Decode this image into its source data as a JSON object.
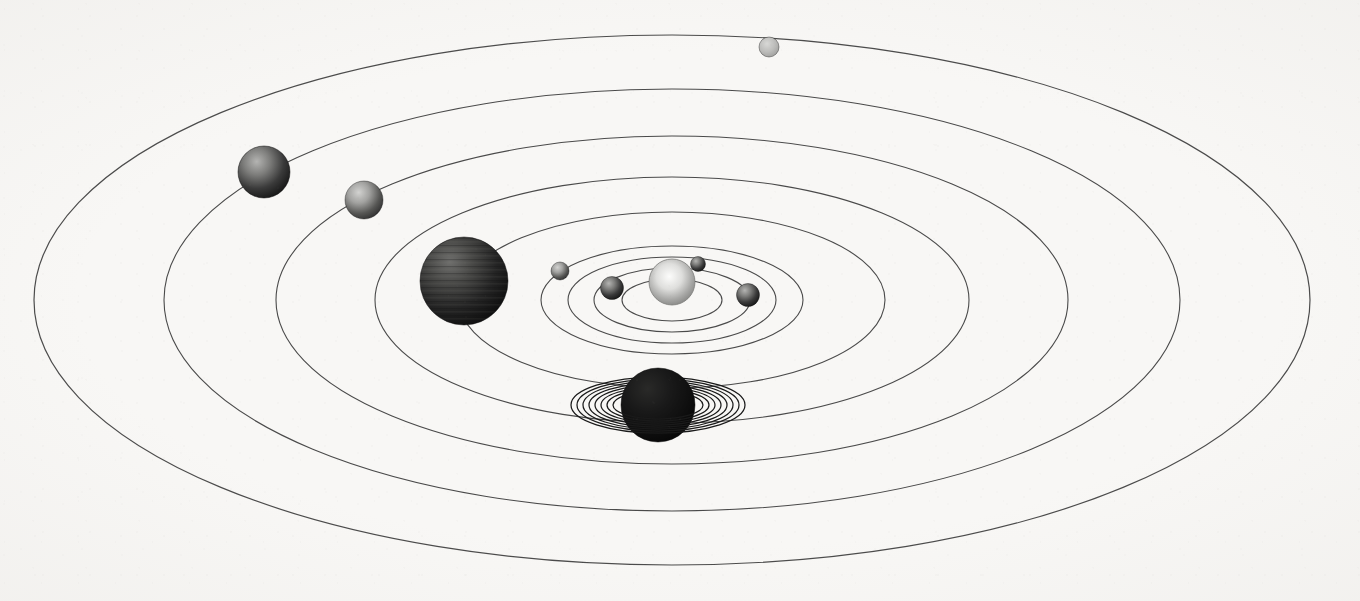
{
  "figure": {
    "view": "oblique elliptical perspective",
    "background_color": "#f8f7f5",
    "orbit_stroke_color": "#4a4a4a",
    "width": 1360,
    "height": 601
  },
  "geometry": {
    "center_x": 672,
    "center_y": 300,
    "aspect_ratio": 0.415
  },
  "star": {
    "name": "Sun",
    "cx": 672,
    "cy": 282,
    "r": 23,
    "color_core": "#f2f2f0",
    "color_edge": "#8e8e8c",
    "label": "Sun"
  },
  "orbits": [
    {
      "name": "Mercury",
      "rx": 50,
      "ry": 21,
      "stroke": "#4a4a4a",
      "stroke_width": 1.1
    },
    {
      "name": "Venus",
      "rx": 78,
      "ry": 32,
      "stroke": "#4a4a4a",
      "stroke_width": 1.1
    },
    {
      "name": "Earth",
      "rx": 104,
      "ry": 43,
      "stroke": "#4a4a4a",
      "stroke_width": 1.1
    },
    {
      "name": "Mars",
      "rx": 131,
      "ry": 54,
      "stroke": "#4a4a4a",
      "stroke_width": 1.1
    },
    {
      "name": "Jupiter",
      "rx": 213,
      "ry": 88,
      "stroke": "#4a4a4a",
      "stroke_width": 1.1
    },
    {
      "name": "Saturn",
      "rx": 297,
      "ry": 123,
      "stroke": "#4a4a4a",
      "stroke_width": 1.1
    },
    {
      "name": "Uranus",
      "rx": 396,
      "ry": 164,
      "stroke": "#4a4a4a",
      "stroke_width": 1.1
    },
    {
      "name": "Neptune",
      "rx": 508,
      "ry": 211,
      "stroke": "#4a4a4a",
      "stroke_width": 1.1
    },
    {
      "name": "Pluto",
      "rx": 638,
      "ry": 265,
      "stroke": "#4a4a4a",
      "stroke_width": 1.2
    }
  ],
  "planets": [
    {
      "name": "Mercury",
      "cx": 698,
      "cy": 264,
      "r": 7.5,
      "color_core": "#8d8d8b",
      "color_edge": "#2c2c2c",
      "shade": "dark-grey"
    },
    {
      "name": "Venus",
      "cx": 748,
      "cy": 295,
      "r": 11.5,
      "color_core": "#8a8a88",
      "color_edge": "#242424",
      "shade": "dark-grey"
    },
    {
      "name": "Earth",
      "cx": 612,
      "cy": 288,
      "r": 11.5,
      "color_core": "#8a8a88",
      "color_edge": "#242424",
      "shade": "dark-grey"
    },
    {
      "name": "Mars",
      "cx": 560,
      "cy": 271,
      "r": 9.0,
      "color_core": "#8f8f8d",
      "color_edge": "#2b2b2b",
      "shade": "mid-grey"
    },
    {
      "name": "Jupiter",
      "cx": 464,
      "cy": 281,
      "r": 44.0,
      "color_core": "#4e4e4c",
      "color_edge": "#161616",
      "shade": "very-dark",
      "banded": true
    },
    {
      "name": "Saturn",
      "cx": 658,
      "cy": 405,
      "r": 37.0,
      "color_core": "#262626",
      "color_edge": "#0b0b0b",
      "shade": "near-black",
      "ringed": true
    },
    {
      "name": "Uranus",
      "cx": 264,
      "cy": 172,
      "r": 26.0,
      "color_core": "#757573",
      "color_edge": "#1e1e1e",
      "shade": "dark-grey"
    },
    {
      "name": "Neptune",
      "cx": 364,
      "cy": 200,
      "r": 19.0,
      "color_core": "#a9a9a7",
      "color_edge": "#414141",
      "shade": "mid-grey"
    },
    {
      "name": "Pluto",
      "cx": 769,
      "cy": 47,
      "r": 10.0,
      "color_core": "#b8b8b6",
      "color_edge": "#6a6a68",
      "shade": "light-grey"
    }
  ],
  "saturn_rings": {
    "planet": "Saturn",
    "cx": 658,
    "cy": 405,
    "ring_count": 8,
    "stroke": "#1a1a1a",
    "rings": [
      {
        "rx": 45,
        "ry": 14
      },
      {
        "rx": 51,
        "ry": 16
      },
      {
        "rx": 57,
        "ry": 18
      },
      {
        "rx": 63,
        "ry": 20
      },
      {
        "rx": 69,
        "ry": 22
      },
      {
        "rx": 75,
        "ry": 24
      },
      {
        "rx": 81,
        "ry": 26
      },
      {
        "rx": 87,
        "ry": 28
      }
    ]
  }
}
